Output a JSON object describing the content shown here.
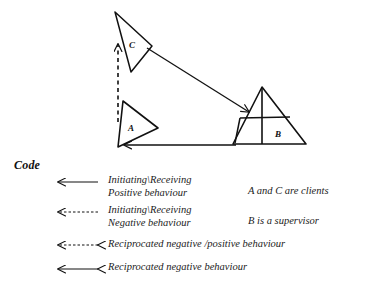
{
  "diagram": {
    "title_label": "Code",
    "nodes": [
      {
        "id": "C",
        "label": "C",
        "role": "client",
        "shape": "triangle",
        "x": 133,
        "y": 45
      },
      {
        "id": "A",
        "label": "A",
        "role": "client",
        "shape": "triangle",
        "x": 133,
        "y": 128
      },
      {
        "id": "B",
        "label": "B",
        "role": "supervisor",
        "shape": "subdivided-triangle",
        "x": 278,
        "y": 134
      }
    ],
    "edges": [
      {
        "from": "C",
        "to": "B",
        "style": "solid",
        "arrows": "single",
        "meaning": "Initiating\\Receiving Positive behaviour"
      },
      {
        "from": "B",
        "to": "A",
        "style": "solid",
        "arrows": "single",
        "meaning": "Initiating\\Receiving Positive behaviour"
      },
      {
        "from": "A",
        "to": "C",
        "style": "dashed",
        "arrows": "single",
        "meaning": "Initiating\\Receiving Negative behaviour"
      }
    ]
  },
  "legend": {
    "heading": "Code",
    "entries": [
      {
        "arrow": "solid-left",
        "label": "Initiating\\Receiving\nPositive behaviour"
      },
      {
        "arrow": "dashed-left",
        "label": "Initiating\\Receiving\nNegative behaviour"
      },
      {
        "arrow": "dashed-both",
        "label": "Reciprocated negative /positive  behaviour"
      },
      {
        "arrow": "solid-both",
        "label": "Reciprocated negative  behaviour"
      }
    ],
    "notes": [
      "A  and C are clients",
      "B is a supervisor"
    ]
  },
  "style": {
    "ink": "#111111",
    "background": "#ffffff"
  }
}
